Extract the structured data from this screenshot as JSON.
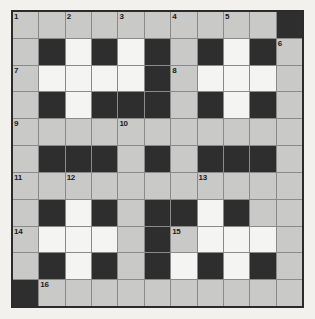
{
  "puzzle": {
    "type": "crossword-grid",
    "rows": 11,
    "columns": 11,
    "colors": {
      "page_background": "#f2f1ee",
      "open_cell": "#c9c9c7",
      "highlight_cell": "#f4f4f2",
      "block_cell": "#2e2e2e",
      "grid_line": "#8a8a8a",
      "border": "#2b2b2b",
      "number_text": "#1b1b1b"
    },
    "legend": {
      "gray": "open letter cell",
      "white": "open letter cell (highlighted / shaded differently)",
      "black": "blocked cell"
    },
    "cells": [
      [
        {
          "type": "gray",
          "number": "1"
        },
        {
          "type": "gray",
          "number": ""
        },
        {
          "type": "gray",
          "number": "2"
        },
        {
          "type": "gray",
          "number": ""
        },
        {
          "type": "gray",
          "number": "3"
        },
        {
          "type": "gray",
          "number": ""
        },
        {
          "type": "gray",
          "number": "4"
        },
        {
          "type": "gray",
          "number": ""
        },
        {
          "type": "gray",
          "number": "5"
        },
        {
          "type": "gray",
          "number": ""
        },
        {
          "type": "black",
          "number": ""
        }
      ],
      [
        {
          "type": "gray",
          "number": ""
        },
        {
          "type": "black",
          "number": ""
        },
        {
          "type": "white",
          "number": ""
        },
        {
          "type": "black",
          "number": ""
        },
        {
          "type": "white",
          "number": ""
        },
        {
          "type": "black",
          "number": ""
        },
        {
          "type": "gray",
          "number": ""
        },
        {
          "type": "black",
          "number": ""
        },
        {
          "type": "white",
          "number": ""
        },
        {
          "type": "black",
          "number": ""
        },
        {
          "type": "gray",
          "number": "6"
        }
      ],
      [
        {
          "type": "gray",
          "number": "7"
        },
        {
          "type": "white",
          "number": ""
        },
        {
          "type": "white",
          "number": ""
        },
        {
          "type": "white",
          "number": ""
        },
        {
          "type": "white",
          "number": ""
        },
        {
          "type": "black",
          "number": ""
        },
        {
          "type": "gray",
          "number": "8"
        },
        {
          "type": "white",
          "number": ""
        },
        {
          "type": "white",
          "number": ""
        },
        {
          "type": "white",
          "number": ""
        },
        {
          "type": "gray",
          "number": ""
        }
      ],
      [
        {
          "type": "gray",
          "number": ""
        },
        {
          "type": "black",
          "number": ""
        },
        {
          "type": "white",
          "number": ""
        },
        {
          "type": "black",
          "number": ""
        },
        {
          "type": "black",
          "number": ""
        },
        {
          "type": "black",
          "number": ""
        },
        {
          "type": "gray",
          "number": ""
        },
        {
          "type": "black",
          "number": ""
        },
        {
          "type": "white",
          "number": ""
        },
        {
          "type": "black",
          "number": ""
        },
        {
          "type": "gray",
          "number": ""
        }
      ],
      [
        {
          "type": "gray",
          "number": "9"
        },
        {
          "type": "gray",
          "number": ""
        },
        {
          "type": "gray",
          "number": ""
        },
        {
          "type": "gray",
          "number": ""
        },
        {
          "type": "gray",
          "number": "10"
        },
        {
          "type": "gray",
          "number": ""
        },
        {
          "type": "gray",
          "number": ""
        },
        {
          "type": "gray",
          "number": ""
        },
        {
          "type": "gray",
          "number": ""
        },
        {
          "type": "gray",
          "number": ""
        },
        {
          "type": "gray",
          "number": ""
        }
      ],
      [
        {
          "type": "gray",
          "number": ""
        },
        {
          "type": "black",
          "number": ""
        },
        {
          "type": "black",
          "number": ""
        },
        {
          "type": "black",
          "number": ""
        },
        {
          "type": "gray",
          "number": ""
        },
        {
          "type": "black",
          "number": ""
        },
        {
          "type": "gray",
          "number": ""
        },
        {
          "type": "black",
          "number": ""
        },
        {
          "type": "black",
          "number": ""
        },
        {
          "type": "black",
          "number": ""
        },
        {
          "type": "gray",
          "number": ""
        }
      ],
      [
        {
          "type": "gray",
          "number": "11"
        },
        {
          "type": "gray",
          "number": ""
        },
        {
          "type": "gray",
          "number": "12"
        },
        {
          "type": "gray",
          "number": ""
        },
        {
          "type": "gray",
          "number": ""
        },
        {
          "type": "gray",
          "number": ""
        },
        {
          "type": "gray",
          "number": ""
        },
        {
          "type": "gray",
          "number": "13"
        },
        {
          "type": "gray",
          "number": ""
        },
        {
          "type": "gray",
          "number": ""
        },
        {
          "type": "gray",
          "number": ""
        }
      ],
      [
        {
          "type": "gray",
          "number": ""
        },
        {
          "type": "black",
          "number": ""
        },
        {
          "type": "white",
          "number": ""
        },
        {
          "type": "black",
          "number": ""
        },
        {
          "type": "gray",
          "number": ""
        },
        {
          "type": "black",
          "number": ""
        },
        {
          "type": "black",
          "number": ""
        },
        {
          "type": "white",
          "number": ""
        },
        {
          "type": "black",
          "number": ""
        },
        {
          "type": "gray",
          "number": ""
        },
        {
          "type": "gray",
          "number": ""
        }
      ],
      [
        {
          "type": "gray",
          "number": "14"
        },
        {
          "type": "white",
          "number": ""
        },
        {
          "type": "white",
          "number": ""
        },
        {
          "type": "white",
          "number": ""
        },
        {
          "type": "gray",
          "number": ""
        },
        {
          "type": "black",
          "number": ""
        },
        {
          "type": "gray",
          "number": "15"
        },
        {
          "type": "white",
          "number": ""
        },
        {
          "type": "white",
          "number": ""
        },
        {
          "type": "white",
          "number": ""
        },
        {
          "type": "gray",
          "number": ""
        }
      ],
      [
        {
          "type": "gray",
          "number": ""
        },
        {
          "type": "black",
          "number": ""
        },
        {
          "type": "white",
          "number": ""
        },
        {
          "type": "black",
          "number": ""
        },
        {
          "type": "gray",
          "number": ""
        },
        {
          "type": "black",
          "number": ""
        },
        {
          "type": "white",
          "number": ""
        },
        {
          "type": "black",
          "number": ""
        },
        {
          "type": "white",
          "number": ""
        },
        {
          "type": "black",
          "number": ""
        },
        {
          "type": "gray",
          "number": ""
        }
      ],
      [
        {
          "type": "black",
          "number": ""
        },
        {
          "type": "gray",
          "number": "16"
        },
        {
          "type": "gray",
          "number": ""
        },
        {
          "type": "gray",
          "number": ""
        },
        {
          "type": "gray",
          "number": ""
        },
        {
          "type": "gray",
          "number": ""
        },
        {
          "type": "gray",
          "number": ""
        },
        {
          "type": "gray",
          "number": ""
        },
        {
          "type": "gray",
          "number": ""
        },
        {
          "type": "gray",
          "number": ""
        },
        {
          "type": "gray",
          "number": ""
        }
      ]
    ]
  }
}
